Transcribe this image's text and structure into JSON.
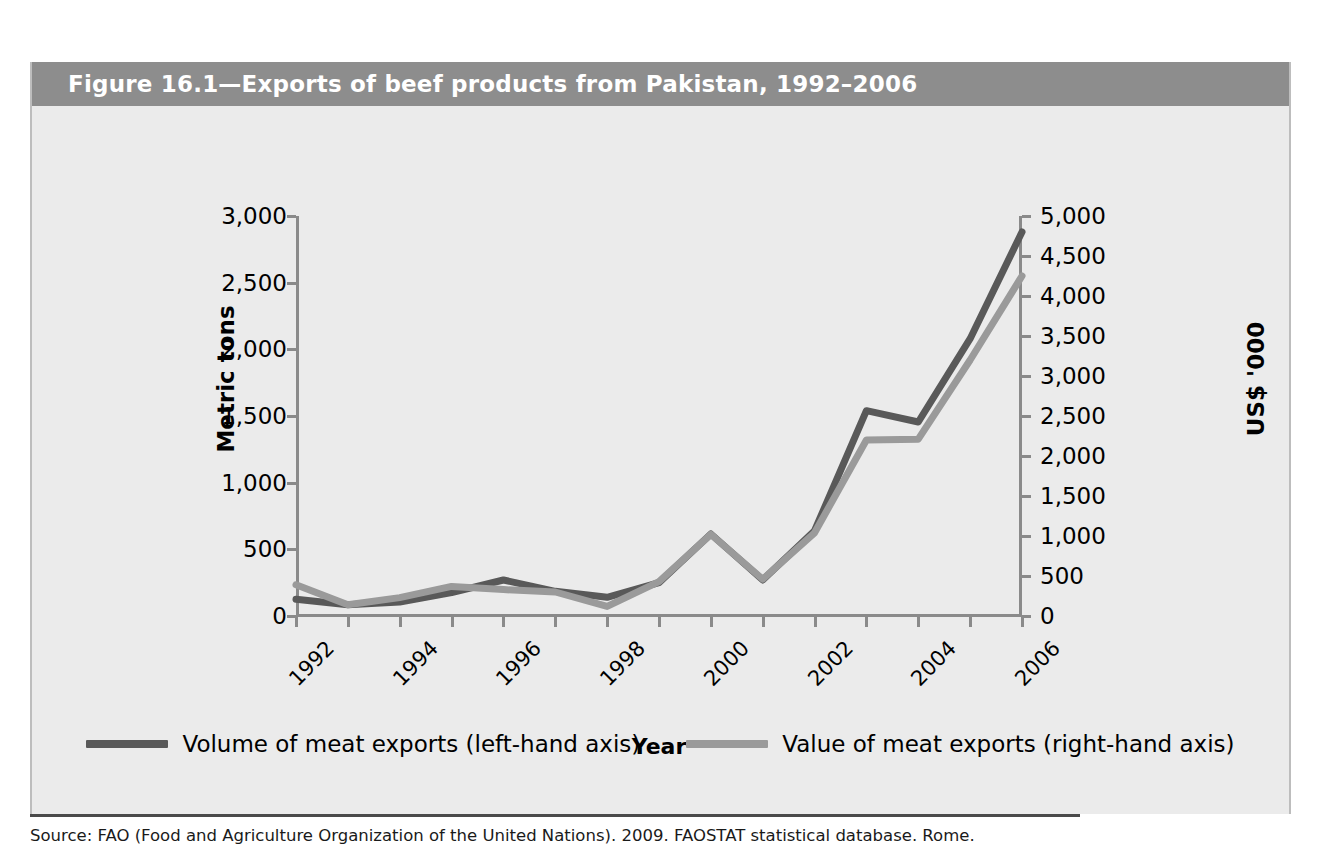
{
  "figure": {
    "title": "Figure 16.1—Exports of beef products from Pakistan, 1992–2006",
    "source": "Source: FAO (Food and Agriculture Organization of the United Nations). 2009. FAOSTAT statistical database. Rome."
  },
  "colors": {
    "header_bar": "#8d8d8d",
    "panel_bg": "#ebebeb",
    "axis": "#8a8a8a",
    "series_volume": "#595959",
    "series_value": "#9a9a9a",
    "source_rule": "#4a4a4a"
  },
  "legend": {
    "position": "bottom",
    "items": [
      {
        "label": "Volume of meat exports (left-hand axis)",
        "color": "#595959"
      },
      {
        "label": "Value of meat exports (right-hand axis)",
        "color": "#9a9a9a"
      }
    ]
  },
  "chart_data": {
    "type": "line",
    "title": "Figure 16.1—Exports of beef products from Pakistan, 1992–2006",
    "xlabel": "Year",
    "grid": false,
    "x": [
      1992,
      1993,
      1994,
      1995,
      1996,
      1997,
      1998,
      1999,
      2000,
      2001,
      2002,
      2003,
      2004,
      2005,
      2006
    ],
    "x_tick_labels": [
      "1992",
      "1994",
      "1996",
      "1998",
      "2000",
      "2002",
      "2004",
      "2006"
    ],
    "x_tick_values": [
      1992,
      1994,
      1996,
      1998,
      2000,
      2002,
      2004,
      2006
    ],
    "axes": [
      {
        "id": "left",
        "label": "Metric tons",
        "ylim": [
          0,
          3000
        ],
        "ticks": [
          0,
          500,
          1000,
          1500,
          2000,
          2500,
          3000
        ],
        "tick_labels": [
          "0",
          "500",
          "1,000",
          "1,500",
          "2,000",
          "2,500",
          "3,000"
        ]
      },
      {
        "id": "right",
        "label": "US$ '000",
        "ylim": [
          0,
          5000
        ],
        "ticks": [
          0,
          500,
          1000,
          1500,
          2000,
          2500,
          3000,
          3500,
          4000,
          4500,
          5000
        ],
        "tick_labels": [
          "0",
          "500",
          "1,000",
          "1,500",
          "2,000",
          "2,500",
          "3,000",
          "3,500",
          "4,000",
          "4,500",
          "5,000"
        ]
      }
    ],
    "series": [
      {
        "name": "Volume of meat exports (left-hand axis)",
        "axis": "left",
        "unit": "metric tons",
        "color": "#595959",
        "values": [
          125,
          85,
          105,
          175,
          270,
          185,
          140,
          250,
          615,
          270,
          640,
          1540,
          1455,
          2080,
          2880
        ]
      },
      {
        "name": "Value of meat exports (right-hand axis)",
        "axis": "right",
        "unit": "US$ '000",
        "color": "#9a9a9a",
        "values": [
          390,
          140,
          230,
          370,
          330,
          300,
          120,
          430,
          1020,
          460,
          1040,
          2200,
          2210,
          3200,
          4250
        ]
      }
    ]
  }
}
